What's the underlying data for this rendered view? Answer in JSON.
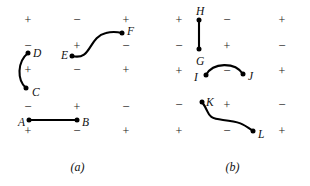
{
  "figure": {
    "type": "two-panel line-integral path diagram",
    "background": "#ffffff",
    "ink_color": "#000000",
    "width": 310,
    "height": 186
  },
  "panels": [
    {
      "id": "a",
      "caption": "(a)",
      "caption_x": 77,
      "caption_y": 166,
      "grid": {
        "columns_x": [
          28,
          77,
          126
        ],
        "rows_y": [
          20,
          46,
          70,
          107,
          131
        ],
        "signs": [
          [
            "+",
            "−",
            "+"
          ],
          [
            "−",
            "+",
            "−"
          ],
          [
            "+",
            "−",
            "+"
          ],
          [
            "−",
            "+",
            "−"
          ],
          [
            "+",
            "−",
            "+"
          ]
        ]
      },
      "points": [
        {
          "label": "A",
          "x": 29,
          "y": 120,
          "label_dx": -11,
          "label_dy": 3
        },
        {
          "label": "B",
          "x": 77,
          "y": 120,
          "label_dx": 5,
          "label_dy": 3
        },
        {
          "label": "C",
          "x": 26,
          "y": 88,
          "label_dx": 6,
          "label_dy": 5
        },
        {
          "label": "D",
          "x": 28,
          "y": 53,
          "label_dx": 5,
          "label_dy": 1
        },
        {
          "label": "E",
          "x": 72,
          "y": 56,
          "label_dx": -11,
          "label_dy": 0
        },
        {
          "label": "F",
          "x": 122,
          "y": 33,
          "label_dx": 5,
          "label_dy": -1
        }
      ],
      "curves": [
        {
          "name": "segment-A-B",
          "kind": "line",
          "d": "M 29 120 L 77 120"
        },
        {
          "name": "curve-C-D",
          "kind": "arc",
          "d": "M 26 88 C 17 80 17 62 28 53"
        },
        {
          "name": "curve-E-F",
          "kind": "s-curve",
          "d": "M 72 56 C 92 61 88 37 106 33 C 113 31 118 32 122 33"
        }
      ]
    },
    {
      "id": "b",
      "caption": "(b)",
      "caption_x": 77,
      "caption_y": 166,
      "grid": {
        "columns_x": [
          24,
          72,
          127
        ],
        "rows_y": [
          20,
          46,
          71,
          105,
          131
        ],
        "signs": [
          [
            "+",
            "−",
            "+"
          ],
          [
            "−",
            "+",
            "−"
          ],
          [
            "+",
            "−",
            "+"
          ],
          [
            "−",
            "+",
            "−"
          ],
          [
            "+",
            "−",
            "+"
          ]
        ]
      },
      "points": [
        {
          "label": "H",
          "x": 44,
          "y": 20,
          "label_dx": -3,
          "label_dy": -8
        },
        {
          "label": "G",
          "x": 44,
          "y": 49,
          "label_dx": -3,
          "label_dy": 13
        },
        {
          "label": "I",
          "x": 51,
          "y": 75,
          "label_dx": -12,
          "label_dy": 3
        },
        {
          "label": "J",
          "x": 88,
          "y": 74,
          "label_dx": 5,
          "label_dy": 3
        },
        {
          "label": "K",
          "x": 47,
          "y": 102,
          "label_dx": 4,
          "label_dy": 1
        },
        {
          "label": "L",
          "x": 98,
          "y": 131,
          "label_dx": 5,
          "label_dy": 4
        }
      ],
      "curves": [
        {
          "name": "segment-H-G",
          "kind": "line",
          "d": "M 44 20 L 44 49"
        },
        {
          "name": "curve-I-J",
          "kind": "arc",
          "d": "M 51 75 C 58 62 80 62 88 74"
        },
        {
          "name": "curve-K-L",
          "kind": "s-curve",
          "d": "M 47 102 C 56 114 50 118 68 120 C 86 122 88 124 98 131"
        }
      ]
    }
  ]
}
